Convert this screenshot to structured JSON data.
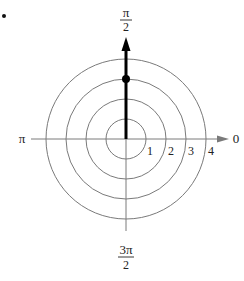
{
  "figure": {
    "type": "polar-coordinate-plot",
    "bullet_marker": "•",
    "axis_labels": {
      "top_numerator": "π",
      "top_denominator": "2",
      "left": "π",
      "right": "0",
      "bottom_numerator": "3π",
      "bottom_denominator": "2"
    },
    "rings": [
      {
        "label": "1",
        "radius": 1
      },
      {
        "label": "2",
        "radius": 2
      },
      {
        "label": "3",
        "radius": 3
      },
      {
        "label": "4",
        "radius": 4
      }
    ],
    "point": {
      "r": 3,
      "theta": "π/2"
    },
    "vector_direction": "π/2",
    "colors": {
      "grid": "#7a7a7a",
      "axis": "#7a7a7a",
      "vector": "#000000",
      "text": "#222222"
    }
  }
}
